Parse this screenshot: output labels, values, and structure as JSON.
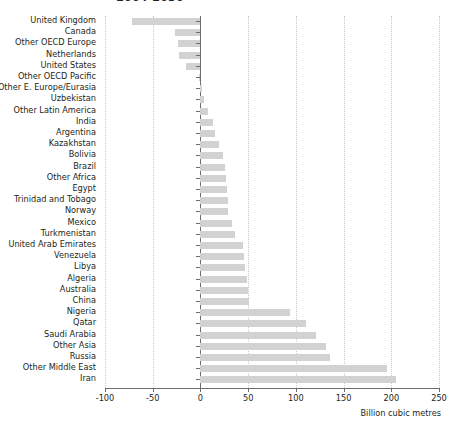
{
  "title": "2004-2030",
  "axis_title": "Billion cubic metres",
  "chart_data": {
    "type": "bar",
    "orientation": "horizontal",
    "title": "2004-2030",
    "xlabel": "Billion cubic metres",
    "ylabel": "",
    "xlim": [
      -100,
      250
    ],
    "xticks": [
      -100,
      -50,
      0,
      50,
      100,
      150,
      200,
      250
    ],
    "xticklabels": [
      "-100",
      "-50",
      "0",
      "50",
      "100",
      "150",
      "200",
      "250"
    ],
    "grid": "vertical-dotted",
    "legend": "none",
    "bar_color": "#d2d2d2",
    "categories": [
      "United Kingdom",
      "Canada",
      "Other OECD Europe",
      "Netherlands",
      "United States",
      "Other OECD Pacific",
      "Other E. Europe/Eurasia",
      "Uzbekistan",
      "Other Latin America",
      "India",
      "Argentina",
      "Kazakhstan",
      "Bolivia",
      "Brazil",
      "Other Africa",
      "Egypt",
      "Trinidad and Tobago",
      "Norway",
      "Mexico",
      "Turkmenistan",
      "United Arab Emirates",
      "Venezuela",
      "Libya",
      "Algeria",
      "Australia",
      "China",
      "Nigeria",
      "Qatar",
      "Saudi Arabia",
      "Other Asia",
      "Russia",
      "Other Middle East",
      "Iran"
    ],
    "values": [
      -72,
      -27,
      -24,
      -22,
      -15,
      -2,
      2,
      4,
      8,
      13,
      15,
      19,
      24,
      26,
      27,
      28,
      29,
      29,
      33,
      36,
      45,
      46,
      47,
      49,
      50,
      51,
      94,
      111,
      121,
      132,
      136,
      196,
      205
    ]
  }
}
